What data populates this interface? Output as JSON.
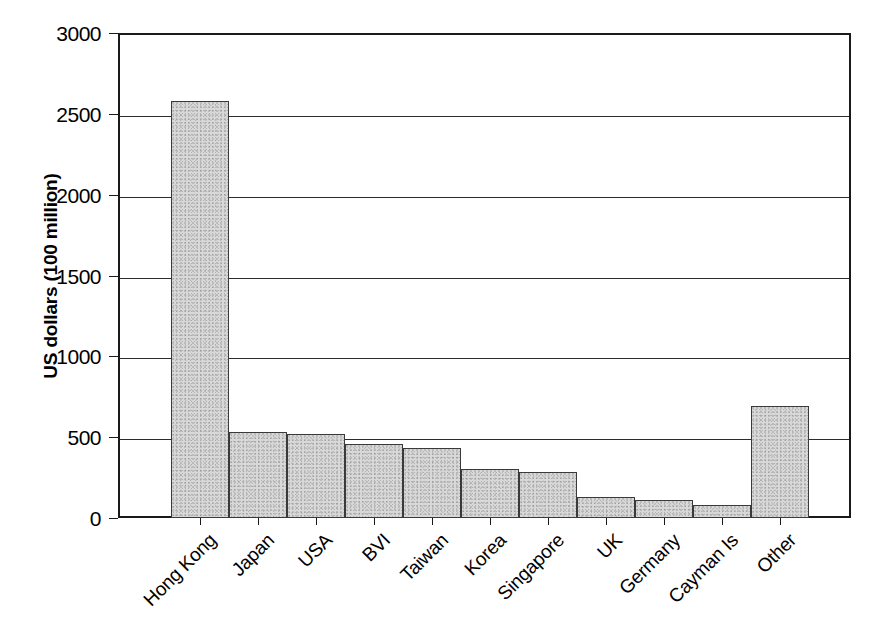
{
  "chart_data": {
    "type": "bar",
    "title": "",
    "subtitle": "",
    "xlabel": "",
    "ylabel": "US dollars (100 million)",
    "categories": [
      "Hong Kong",
      "Japan",
      "USA",
      "BVI",
      "Taiwan",
      "Korea",
      "Singapore",
      "UK",
      "Germany",
      "Cayman Is",
      "Other"
    ],
    "values": [
      2580,
      530,
      520,
      455,
      430,
      305,
      285,
      130,
      110,
      80,
      695
    ],
    "ylim": [
      0,
      3000
    ],
    "ytick_labels": [
      "3000",
      "2500",
      "2000",
      "1500",
      "1000",
      "500",
      "0"
    ],
    "ytick_values": [
      3000,
      2500,
      2000,
      1500,
      1000,
      500,
      0
    ],
    "grid": true,
    "grid_axis": "y",
    "legend": false,
    "legend_position": "none",
    "bar_fill": "#d8d8d8",
    "bar_edge": "#3a3a3a",
    "axis_color": "#1a1a1a",
    "background": "#ffffff"
  }
}
